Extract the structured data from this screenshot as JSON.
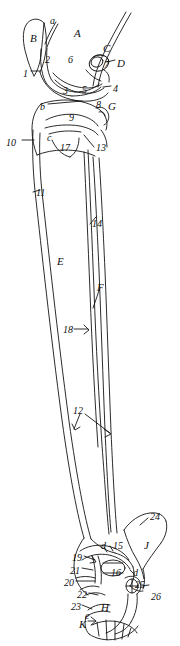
{
  "figure": {
    "name": "hind-limb-skeleton-lateral-view",
    "stroke_color": "#141414",
    "background_color": "#ffffff",
    "width": 180,
    "height": 646
  },
  "labels": {
    "letters_uppercase": [
      {
        "id": "A",
        "text": "A",
        "x": 74,
        "y": 28
      },
      {
        "id": "B",
        "text": "B",
        "x": 30,
        "y": 33
      },
      {
        "id": "C",
        "text": "C",
        "x": 103,
        "y": 43
      },
      {
        "id": "D",
        "text": "D",
        "x": 117,
        "y": 58
      },
      {
        "id": "E",
        "text": "E",
        "x": 57,
        "y": 256
      },
      {
        "id": "F",
        "text": "F",
        "x": 97,
        "y": 282
      },
      {
        "id": "G",
        "text": "G",
        "x": 108,
        "y": 101
      },
      {
        "id": "H",
        "text": "H",
        "x": 101,
        "y": 602
      },
      {
        "id": "J",
        "text": "J",
        "x": 144,
        "y": 540
      },
      {
        "id": "K",
        "text": "K",
        "x": 79,
        "y": 619
      }
    ],
    "letters_lowercase": [
      {
        "id": "a",
        "text": "a",
        "x": 50,
        "y": 16
      },
      {
        "id": "b",
        "text": "b",
        "x": 40,
        "y": 102
      },
      {
        "id": "c",
        "text": "c",
        "x": 47,
        "y": 133
      },
      {
        "id": "d1",
        "text": "d",
        "x": 101,
        "y": 541
      },
      {
        "id": "d2",
        "text": "d",
        "x": 133,
        "y": 568
      },
      {
        "id": "e",
        "text": "e",
        "x": 85,
        "y": 611
      }
    ],
    "numbers": [
      {
        "id": "1",
        "text": "1",
        "x": 23,
        "y": 69
      },
      {
        "id": "2",
        "text": "2",
        "x": 45,
        "y": 55
      },
      {
        "id": "3",
        "text": "3",
        "x": 63,
        "y": 86
      },
      {
        "id": "4",
        "text": "4",
        "x": 113,
        "y": 84
      },
      {
        "id": "5",
        "text": "5",
        "x": 82,
        "y": 85
      },
      {
        "id": "6",
        "text": "6",
        "x": 68,
        "y": 55
      },
      {
        "id": "7",
        "text": "7",
        "x": 104,
        "y": 60
      },
      {
        "id": "8",
        "text": "8",
        "x": 96,
        "y": 100
      },
      {
        "id": "9",
        "text": "9",
        "x": 69,
        "y": 113
      },
      {
        "id": "10",
        "text": "10",
        "x": 6,
        "y": 138
      },
      {
        "id": "11",
        "text": "11",
        "x": 36,
        "y": 188
      },
      {
        "id": "12",
        "text": "12",
        "x": 73,
        "y": 406
      },
      {
        "id": "13",
        "text": "13",
        "x": 96,
        "y": 143
      },
      {
        "id": "14",
        "text": "14",
        "x": 92,
        "y": 219
      },
      {
        "id": "15",
        "text": "15",
        "x": 113,
        "y": 541
      },
      {
        "id": "16",
        "text": "16",
        "x": 111,
        "y": 568
      },
      {
        "id": "17",
        "text": "17",
        "x": 60,
        "y": 143
      },
      {
        "id": "18",
        "text": "18",
        "x": 63,
        "y": 325
      },
      {
        "id": "19",
        "text": "19",
        "x": 72,
        "y": 553
      },
      {
        "id": "20",
        "text": "20",
        "x": 64,
        "y": 578
      },
      {
        "id": "21",
        "text": "21",
        "x": 70,
        "y": 566
      },
      {
        "id": "22",
        "text": "22",
        "x": 77,
        "y": 590
      },
      {
        "id": "23",
        "text": "23",
        "x": 71,
        "y": 602
      },
      {
        "id": "24",
        "text": "24",
        "x": 150,
        "y": 512
      },
      {
        "id": "25",
        "text": "25",
        "x": 135,
        "y": 580
      },
      {
        "id": "26",
        "text": "26",
        "x": 151,
        "y": 592
      }
    ]
  }
}
